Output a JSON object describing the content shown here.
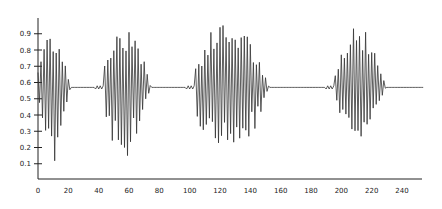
{
  "chart_data": {
    "type": "line",
    "title": "",
    "xlabel": "",
    "ylabel": "",
    "xlim": [
      0,
      255
    ],
    "ylim": [
      0,
      1.0
    ],
    "grid": false,
    "legend": null,
    "x_ticks": [
      0,
      20,
      40,
      60,
      80,
      100,
      120,
      140,
      160,
      180,
      200,
      220,
      240
    ],
    "y_ticks": [
      0.1,
      0.2,
      0.3,
      0.4,
      0.5,
      0.6,
      0.7,
      0.8,
      0.9
    ],
    "x_tick_labels": [
      "0",
      "20",
      "40",
      "60",
      "80",
      "100",
      "120",
      "140",
      "160",
      "180",
      "200",
      "220",
      "240"
    ],
    "y_tick_labels": [
      "0.1",
      "0.2",
      "0.3",
      "0.4",
      "0.5",
      "0.6",
      "0.7",
      "0.8",
      "0.9"
    ],
    "series": [
      {
        "name": "signal",
        "description": "Oscillating time series around 0.55 with bursts of large-amplitude oscillations separated by quiet near-constant segments (~x=38-44, ~x=98-104, ~x=190-196)",
        "baseline": 0.57,
        "bursts": [
          {
            "x_start": 0,
            "x_end": 38,
            "min": 0.1,
            "max": 0.92
          },
          {
            "x_start": 44,
            "x_end": 98,
            "min": 0.02,
            "max": 0.97
          },
          {
            "x_start": 104,
            "x_end": 190,
            "min": 0.02,
            "max": 0.97
          },
          {
            "x_start": 196,
            "x_end": 255,
            "min": 0.15,
            "max": 0.95
          }
        ],
        "quiet_segments": [
          {
            "x_start": 38,
            "x_end": 44,
            "value": 0.57
          },
          {
            "x_start": 98,
            "x_end": 104,
            "value": 0.57
          },
          {
            "x_start": 190,
            "x_end": 196,
            "value": 0.57
          }
        ],
        "color": "#333333"
      }
    ]
  }
}
